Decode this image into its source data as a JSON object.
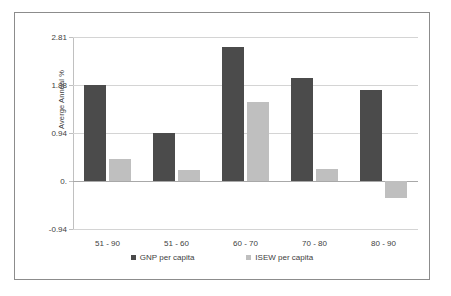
{
  "chart_data": {
    "type": "bar",
    "title": "",
    "xlabel": "",
    "ylabel": "Averge Annual %",
    "categories": [
      "51 - 90",
      "51 - 60",
      "60 - 70",
      "70 - 80",
      "80 - 90"
    ],
    "series": [
      {
        "name": "GNP per capita",
        "color": "#4b4b4b",
        "values": [
          1.88,
          0.93,
          2.62,
          2.01,
          1.78
        ]
      },
      {
        "name": "ISEW per capita",
        "color": "#bfbfbf",
        "values": [
          0.42,
          0.21,
          1.55,
          0.24,
          -0.33
        ]
      }
    ],
    "yticks": [
      "2.81",
      "1.88",
      "0.94",
      "0.",
      "-0.94"
    ],
    "ytick_values": [
      2.81,
      1.88,
      0.94,
      0.0,
      -0.94
    ],
    "ylim": [
      -0.94,
      2.81
    ],
    "grid": true,
    "legend_position": "bottom"
  },
  "legend": {
    "items": [
      {
        "label": "GNP per capita"
      },
      {
        "label": "ISEW per capita"
      }
    ]
  }
}
